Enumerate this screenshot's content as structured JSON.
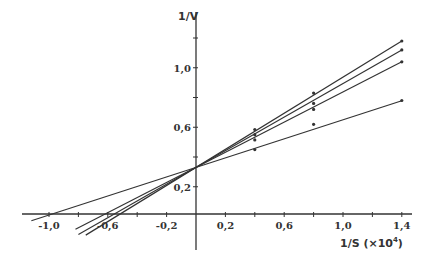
{
  "chart_data": {
    "type": "line",
    "title": "",
    "xlabel": "1/S (×10",
    "xlabel_exponent": "4",
    "xlabel_close": ")",
    "ylabel": "1/V",
    "xlim": [
      -1.1,
      1.45
    ],
    "ylim": [
      -0.15,
      1.25
    ],
    "grid": false,
    "legend": "none",
    "x_ticks": [
      -1.0,
      -0.8,
      -0.6,
      -0.4,
      -0.2,
      0.2,
      0.4,
      0.6,
      0.8,
      1.0,
      1.2,
      1.4
    ],
    "x_tick_labels": [
      {
        "value": -1.0,
        "label": "-1,0"
      },
      {
        "value": -0.6,
        "label": "-0,6"
      },
      {
        "value": -0.2,
        "label": "-0,2"
      },
      {
        "value": 0.2,
        "label": "0,2"
      },
      {
        "value": 0.6,
        "label": "0,6"
      },
      {
        "value": 1.0,
        "label": "1,0"
      },
      {
        "value": 1.4,
        "label": "1,4"
      }
    ],
    "y_ticks": [
      0.2,
      0.4,
      0.6,
      0.8,
      1.0,
      1.2
    ],
    "y_tick_labels": [
      {
        "value": 0.2,
        "label": "0,2"
      },
      {
        "value": 0.6,
        "label": "0,6"
      },
      {
        "value": 1.0,
        "label": "1,0"
      }
    ],
    "series": [
      {
        "name": "line-1",
        "intercept": 0.33,
        "slope": 0.607,
        "x_start": -0.75,
        "x_end": 1.4,
        "points": [
          {
            "x": 0.4,
            "y": 0.585
          },
          {
            "x": 0.8,
            "y": 0.83
          },
          {
            "x": 1.4,
            "y": 1.18
          }
        ]
      },
      {
        "name": "line-2",
        "intercept": 0.33,
        "slope": 0.564,
        "x_start": -0.8,
        "x_end": 1.4,
        "points": [
          {
            "x": 0.4,
            "y": 0.55
          },
          {
            "x": 0.8,
            "y": 0.76
          },
          {
            "x": 1.4,
            "y": 1.12
          }
        ]
      },
      {
        "name": "line-3",
        "intercept": 0.33,
        "slope": 0.507,
        "x_start": -0.82,
        "x_end": 1.4,
        "points": [
          {
            "x": 0.4,
            "y": 0.515
          },
          {
            "x": 0.8,
            "y": 0.72
          },
          {
            "x": 1.4,
            "y": 1.04
          }
        ]
      },
      {
        "name": "line-4",
        "intercept": 0.33,
        "slope": 0.32,
        "x_start": -1.12,
        "x_end": 1.4,
        "points": [
          {
            "x": 0.4,
            "y": 0.45
          },
          {
            "x": 0.8,
            "y": 0.62
          },
          {
            "x": 1.4,
            "y": 0.78
          }
        ]
      }
    ]
  },
  "colors": {
    "ink": "#333333",
    "background": "#ffffff"
  }
}
